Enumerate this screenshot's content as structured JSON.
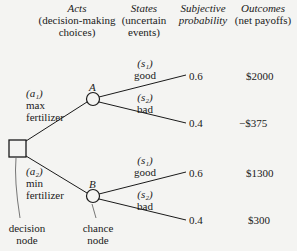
{
  "headers": {
    "acts": {
      "title": "Acts",
      "sub1": "(decision-making",
      "sub2": "choices)"
    },
    "states": {
      "title": "States",
      "sub1": "(uncertain",
      "sub2": "events)"
    },
    "probability": {
      "title1": "Subjective",
      "title2": "probability"
    },
    "outcomes": {
      "title": "Outcomes",
      "sub1": "(net payoffs)"
    }
  },
  "acts": [
    {
      "id": "(a₁)",
      "line1": "max",
      "line2": "fertilizer"
    },
    {
      "id": "(a₂)",
      "line1": "min",
      "line2": "fertilizer"
    }
  ],
  "nodes": {
    "chance_a": "A",
    "chance_b": "B",
    "decision_label1": "decision",
    "decision_label2": "node",
    "chance_label1": "chance",
    "chance_label2": "node"
  },
  "branches": [
    {
      "node": "A",
      "state_id": "(s₁)",
      "state": "good",
      "probability": "0.6",
      "outcome": "$2000"
    },
    {
      "node": "A",
      "state_id": "(s₂)",
      "state": "bad",
      "probability": "0.4",
      "outcome": "−$375"
    },
    {
      "node": "B",
      "state_id": "(s₁)",
      "state": "good",
      "probability": "0.6",
      "outcome": "$1300"
    },
    {
      "node": "B",
      "state_id": "(s₂)",
      "state": "bad",
      "probability": "0.4",
      "outcome": "$300"
    }
  ]
}
